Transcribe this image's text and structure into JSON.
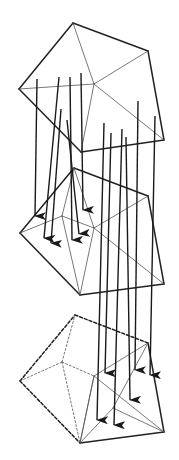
{
  "diagram": {
    "title": "",
    "colors": {
      "stroke": "#222222",
      "thin_stroke": "#555555",
      "background": "#ffffff"
    },
    "meshes": [
      {
        "id": "top",
        "style": "solid",
        "outline": [
          [
            73,
            23
          ],
          [
            148,
            51
          ],
          [
            164,
            140
          ],
          [
            81,
            152
          ],
          [
            19,
            89
          ]
        ],
        "inner_edges": [
          [
            [
              73,
              23
            ],
            [
              94,
              84
            ]
          ],
          [
            [
              148,
              51
            ],
            [
              94,
              84
            ]
          ],
          [
            [
              164,
              140
            ],
            [
              94,
              84
            ]
          ],
          [
            [
              81,
              152
            ],
            [
              94,
              84
            ]
          ],
          [
            [
              19,
              89
            ],
            [
              94,
              84
            ]
          ]
        ]
      },
      {
        "id": "middle",
        "style": "solid",
        "outline": [
          [
            74,
            168
          ],
          [
            148,
            196
          ],
          [
            164,
            284
          ],
          [
            80,
            295
          ],
          [
            20,
            233
          ]
        ],
        "inner_edges": [
          [
            [
              20,
              233
            ],
            [
              62,
              216
            ]
          ],
          [
            [
              62,
              216
            ],
            [
              74,
              168
            ]
          ],
          [
            [
              62,
              216
            ],
            [
              80,
              295
            ]
          ],
          [
            [
              74,
              168
            ],
            [
              94,
              228
            ]
          ],
          [
            [
              148,
              196
            ],
            [
              94,
              228
            ]
          ],
          [
            [
              164,
              284
            ],
            [
              94,
              228
            ]
          ],
          [
            [
              80,
              295
            ],
            [
              94,
              228
            ]
          ],
          [
            [
              62,
              216
            ],
            [
              94,
              228
            ]
          ]
        ]
      },
      {
        "id": "bottom",
        "style": "partial-dashed",
        "outline_dashed": [
          [
            [
              20,
              381
            ],
            [
              75,
              315
            ]
          ],
          [
            [
              75,
              315
            ],
            [
              148,
              343
            ]
          ],
          [
            [
              20,
              381
            ],
            [
              80,
              443
            ]
          ]
        ],
        "outline_solid": [
          [
            [
              148,
              343
            ],
            [
              164,
              432
            ]
          ],
          [
            [
              164,
              432
            ],
            [
              80,
              443
            ]
          ]
        ],
        "inner_dashed": [
          [
            [
              20,
              381
            ],
            [
              62,
              362
            ]
          ],
          [
            [
              62,
              362
            ],
            [
              75,
              315
            ]
          ],
          [
            [
              62,
              362
            ],
            [
              80,
              443
            ]
          ],
          [
            [
              62,
              362
            ],
            [
              94,
              376
            ]
          ]
        ],
        "inner_solid": [
          [
            [
              148,
              343
            ],
            [
              94,
              376
            ]
          ],
          [
            [
              164,
              432
            ],
            [
              94,
              376
            ]
          ],
          [
            [
              80,
              443
            ],
            [
              94,
              376
            ]
          ],
          [
            [
              94,
              376
            ],
            [
              80,
              443
            ]
          ],
          [
            [
              148,
              343
            ],
            [
              113,
              408
            ]
          ],
          [
            [
              113,
              408
            ],
            [
              80,
              443
            ]
          ],
          [
            [
              113,
              408
            ],
            [
              164,
              432
            ]
          ]
        ]
      }
    ],
    "arrows": [
      {
        "from": [
          37,
          79
        ],
        "to": [
          35,
          216
        ]
      },
      {
        "from": [
          59,
          77
        ],
        "to": [
          44,
          238
        ]
      },
      {
        "from": [
          61,
          109
        ],
        "to": [
          51,
          243
        ]
      },
      {
        "from": [
          70,
          77
        ],
        "to": [
          72,
          240
        ]
      },
      {
        "from": [
          67,
          120
        ],
        "to": [
          79,
          234
        ]
      },
      {
        "from": [
          81,
          73
        ],
        "to": [
          83,
          210
        ]
      },
      {
        "from": [
          104,
          123
        ],
        "to": [
          97,
          420
        ]
      },
      {
        "from": [
          111,
          133
        ],
        "to": [
          105,
          373
        ]
      },
      {
        "from": [
          122,
          129
        ],
        "to": [
          114,
          425
        ]
      },
      {
        "from": [
          126,
          137
        ],
        "to": [
          130,
          400
        ]
      },
      {
        "from": [
          138,
          101
        ],
        "to": [
          135,
          370
        ]
      },
      {
        "from": [
          155,
          116
        ],
        "to": [
          150,
          375
        ]
      }
    ]
  }
}
